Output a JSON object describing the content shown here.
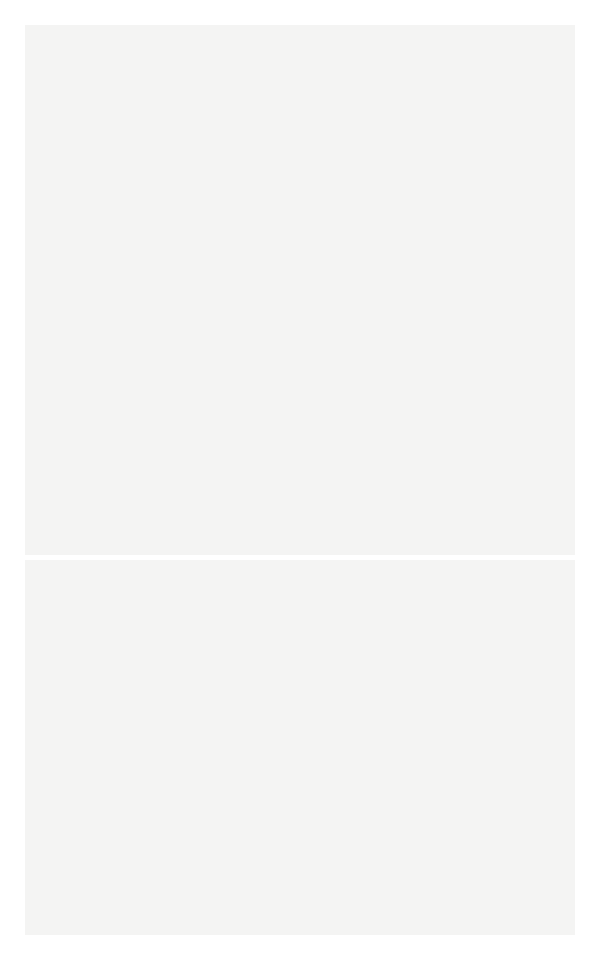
{
  "top_diagram": {
    "title": "",
    "unit_label": "lichtjaren",
    "axis": {
      "y": 474,
      "x_start": 30,
      "x_end": 572,
      "ticks": [
        {
          "x": 30,
          "label": "40.000"
        },
        {
          "x": 107,
          "label": "− 20.000"
        },
        {
          "x": 184,
          "label": "0"
        },
        {
          "x": 262,
          "label": "+ 20.000"
        },
        {
          "x": 340,
          "label": "+ 40.000"
        },
        {
          "x": 418,
          "label": "+ 60.000"
        },
        {
          "x": 495,
          "label": "+ 80.000"
        },
        {
          "x": 572,
          "label": "+ 100.000"
        }
      ]
    },
    "galaxy": {
      "cx": 185,
      "cy": 270,
      "rx": 63,
      "ry": 12,
      "core_rx": 26,
      "core_ry": 6
    },
    "globular_clusters": [
      [
        389,
        90
      ],
      [
        345,
        127
      ],
      [
        420,
        131
      ],
      [
        290,
        139
      ],
      [
        472,
        148
      ],
      [
        258,
        151
      ],
      [
        384,
        163
      ],
      [
        514,
        191
      ],
      [
        432,
        202
      ],
      [
        322,
        194
      ],
      [
        270,
        206
      ],
      [
        394,
        219
      ],
      [
        360,
        224
      ],
      [
        423,
        234
      ],
      [
        554,
        241
      ],
      [
        324,
        237
      ],
      [
        390,
        237
      ],
      [
        410,
        237
      ],
      [
        359,
        254
      ],
      [
        378,
        254
      ],
      [
        398,
        254
      ],
      [
        456,
        253
      ],
      [
        502,
        262
      ],
      [
        247,
        252
      ],
      [
        290,
        253
      ],
      [
        428,
        261
      ],
      [
        370,
        267
      ],
      [
        386,
        263
      ],
      [
        344,
        277
      ],
      [
        299,
        277
      ],
      [
        371,
        281
      ],
      [
        385,
        279
      ],
      [
        401,
        276
      ],
      [
        418,
        287
      ],
      [
        234,
        297
      ],
      [
        386,
        302
      ],
      [
        465,
        318
      ],
      [
        416,
        313
      ],
      [
        363,
        326
      ],
      [
        217,
        339
      ],
      [
        304,
        339
      ],
      [
        430,
        366
      ],
      [
        517,
        373
      ],
      [
        269,
        379
      ],
      [
        341,
        389
      ],
      [
        459,
        414
      ],
      [
        357,
        433
      ],
      [
        425,
        443
      ]
    ],
    "field_stars": [
      [
        512,
        50
      ],
      [
        140,
        102
      ],
      [
        497,
        132
      ],
      [
        526,
        139
      ],
      [
        69,
        201
      ],
      [
        51,
        265
      ],
      [
        58,
        279
      ],
      [
        72,
        270
      ],
      [
        82,
        263
      ],
      [
        99,
        258
      ],
      [
        100,
        275
      ],
      [
        110,
        248
      ],
      [
        118,
        258
      ],
      [
        128,
        245
      ],
      [
        93,
        293
      ],
      [
        108,
        282
      ]
    ]
  },
  "bottom_diagram": {
    "axis": {
      "y": 918,
      "x_start": 32,
      "x_end": 573,
      "ticks": [
        {
          "x": 59,
          "label": "−10 000",
          "major": true
        },
        {
          "x": 101,
          "label": "",
          "major": false
        },
        {
          "x": 141,
          "label": "+0.000",
          "major": true
        },
        {
          "x": 182,
          "label": "",
          "major": false
        },
        {
          "x": 215,
          "label": "",
          "major": false
        },
        {
          "x": 223,
          "label": "−800 0 +700",
          "major": true
        },
        {
          "x": 264,
          "label": "",
          "major": false
        },
        {
          "x": 305,
          "label": "+8 000",
          "major": true
        },
        {
          "x": 347,
          "label": "",
          "major": false
        },
        {
          "x": 388,
          "label": "+10 000",
          "major": true
        },
        {
          "x": 429,
          "label": "",
          "major": false
        },
        {
          "x": 470,
          "label": "+16000",
          "major": true
        },
        {
          "x": 511,
          "label": "β°",
          "major": false
        }
      ]
    },
    "galaxy": {
      "cx": 325,
      "cy": 723,
      "disk_half_width": 220,
      "halo_half_width": 250
    }
  }
}
